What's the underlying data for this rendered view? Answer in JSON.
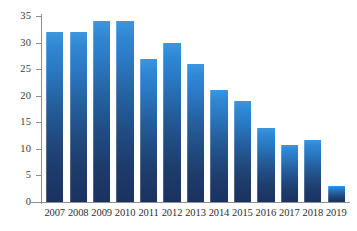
{
  "chart_data": {
    "type": "bar",
    "title": "",
    "subtitle": "",
    "xlabel": "",
    "ylabel": "",
    "categories": [
      "2007",
      "2008",
      "2009",
      "2010",
      "2011",
      "2012",
      "2013",
      "2014",
      "2015",
      "2016",
      "2017",
      "2018",
      "2019"
    ],
    "values": [
      32,
      32,
      34,
      34,
      27,
      30,
      26,
      21,
      19,
      14,
      10.7,
      11.6,
      3
    ],
    "series": [
      {
        "name": "",
        "values": [
          32,
          32,
          34,
          34,
          27,
          30,
          26,
          21,
          19,
          14,
          10.7,
          11.6,
          3
        ]
      }
    ],
    "ylim": [
      0,
      35
    ],
    "y_ticks": [
      0,
      5,
      10,
      15,
      20,
      25,
      30,
      35
    ],
    "y_tick_labels": [
      "0",
      "5",
      "10",
      "15",
      "20",
      "25",
      "30",
      "35"
    ],
    "grid": false,
    "legend": false,
    "legend_position": "none",
    "annotations": [],
    "colors": {
      "bar_top": "#3C96DE",
      "bar_bottom": "#1B3260",
      "axis": "#8D8F91",
      "tick_label": "#3A3A3C",
      "category_label": "#2F2F31",
      "background": "#FFFFFF"
    }
  }
}
